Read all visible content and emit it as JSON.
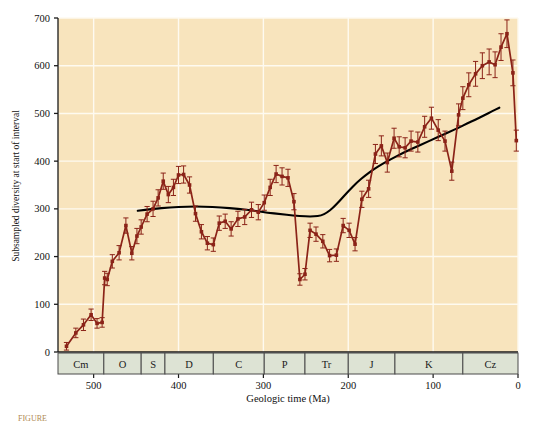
{
  "figure": {
    "background": "#ffffff",
    "plot_background": "#f8e4bd",
    "grid_color": "#fefaf0",
    "series_color": "#8b2318",
    "trend_color": "#000000",
    "period_bar_fill": "#dde3d4",
    "period_bar_stroke": "#4a4a4a",
    "axis_color": "#1a1a1a"
  },
  "caption": {
    "partial_text": "FIGURE"
  },
  "chart_data": {
    "type": "line",
    "title": "",
    "xlabel": "Geologic time (Ma)",
    "ylabel": "Subsampled diversity at start of interval",
    "xlim": [
      542,
      0
    ],
    "ylim": [
      0,
      700
    ],
    "x_reversed": true,
    "grid": true,
    "legend": "none",
    "xticks": [
      500,
      400,
      300,
      200,
      100,
      0
    ],
    "yticks": [
      0,
      100,
      200,
      300,
      400,
      500,
      600,
      700
    ],
    "period_axis": {
      "name": "geologic-periods",
      "bands": [
        {
          "label": "Cm",
          "start": 542,
          "end": 488
        },
        {
          "label": "O",
          "start": 488,
          "end": 444
        },
        {
          "label": "S",
          "start": 444,
          "end": 416
        },
        {
          "label": "D",
          "start": 416,
          "end": 359
        },
        {
          "label": "C",
          "start": 359,
          "end": 299
        },
        {
          "label": "P",
          "start": 299,
          "end": 251
        },
        {
          "label": "Tr",
          "start": 251,
          "end": 200
        },
        {
          "label": "J",
          "start": 200,
          "end": 145
        },
        {
          "label": "K",
          "start": 145,
          "end": 65
        },
        {
          "label": "Cz",
          "start": 65,
          "end": 0
        }
      ]
    },
    "series": [
      {
        "name": "Subsampled diversity",
        "style": "markers-with-error-bars",
        "x": [
          532,
          521,
          512,
          503,
          496,
          490,
          487,
          484,
          478,
          470,
          462,
          455,
          449,
          444,
          437,
          430,
          424,
          418,
          412,
          406,
          400,
          394,
          387,
          380,
          373,
          366,
          359,
          352,
          345,
          338,
          330,
          322,
          314,
          306,
          299,
          292,
          285,
          278,
          271,
          264,
          257,
          251,
          245,
          238,
          230,
          222,
          214,
          206,
          199,
          192,
          184,
          176,
          168,
          161,
          154,
          146,
          140,
          133,
          126,
          118,
          110,
          102,
          94,
          86,
          78,
          70,
          65,
          58,
          50,
          42,
          34,
          27,
          20,
          13,
          6,
          2
        ],
        "y": [
          12,
          40,
          57,
          78,
          60,
          62,
          155,
          152,
          190,
          208,
          265,
          207,
          243,
          262,
          289,
          300,
          323,
          358,
          330,
          345,
          371,
          372,
          350,
          290,
          252,
          228,
          225,
          270,
          274,
          258,
          279,
          283,
          298,
          293,
          313,
          345,
          373,
          368,
          365,
          315,
          152,
          163,
          255,
          247,
          232,
          202,
          203,
          265,
          255,
          226,
          320,
          342,
          415,
          432,
          397,
          448,
          430,
          428,
          442,
          440,
          472,
          490,
          465,
          442,
          379,
          497,
          532,
          560,
          583,
          600,
          608,
          602,
          639,
          667,
          585,
          443
        ],
        "yerr": [
          8,
          10,
          12,
          12,
          10,
          10,
          14,
          13,
          14,
          15,
          16,
          14,
          16,
          15,
          16,
          16,
          17,
          17,
          17,
          17,
          18,
          18,
          17,
          16,
          15,
          14,
          14,
          15,
          15,
          15,
          16,
          16,
          16,
          16,
          16,
          17,
          18,
          18,
          18,
          17,
          12,
          12,
          15,
          15,
          14,
          13,
          13,
          15,
          15,
          14,
          17,
          18,
          20,
          21,
          20,
          21,
          21,
          21,
          21,
          21,
          22,
          23,
          22,
          21,
          19,
          23,
          24,
          25,
          26,
          27,
          27,
          27,
          28,
          29,
          27,
          22
        ]
      },
      {
        "name": "Fitted trend",
        "style": "smooth-line",
        "x": [
          448,
          430,
          410,
          390,
          370,
          350,
          330,
          310,
          295,
          280,
          265,
          250,
          240,
          232,
          225,
          218,
          210,
          200,
          190,
          180,
          170,
          160,
          150,
          140,
          130,
          120,
          110,
          100,
          90,
          80,
          70,
          60,
          50,
          40,
          30,
          22
        ],
        "y": [
          296,
          300,
          303,
          305,
          305,
          303,
          300,
          296,
          292,
          289,
          286,
          284,
          284,
          286,
          292,
          302,
          317,
          337,
          355,
          370,
          383,
          394,
          404,
          413,
          422,
          430,
          438,
          446,
          454,
          462,
          470,
          479,
          487,
          496,
          505,
          512
        ]
      }
    ]
  }
}
